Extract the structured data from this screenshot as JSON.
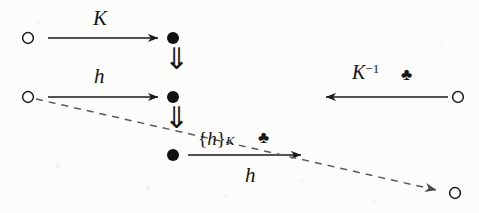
{
  "figure": {
    "kind": "commutative-diagram",
    "background_color": "#fcfcfa",
    "ink_color": "#151515",
    "width": 479,
    "height": 213
  },
  "nodes": {
    "top_left_circle": {
      "shape": "open-circle",
      "x": 28,
      "y": 38
    },
    "top_right_dot": {
      "shape": "filled-dot",
      "x": 173,
      "y": 38
    },
    "middle_left_circle": {
      "shape": "open-circle",
      "x": 28,
      "y": 97
    },
    "middle_center_dot": {
      "shape": "filled-dot",
      "x": 173,
      "y": 97
    },
    "middle_right_circle": {
      "shape": "open-circle",
      "x": 458,
      "y": 97
    },
    "bottom_center_dot": {
      "shape": "filled-dot",
      "x": 173,
      "y": 155
    },
    "bottom_right_circle": {
      "shape": "open-circle",
      "x": 455,
      "y": 193
    }
  },
  "arrows": {
    "row1": {
      "label": "K",
      "from_x": 48,
      "to_x": 162,
      "y": 38,
      "direction": "right",
      "style": "solid"
    },
    "row2": {
      "label": "h",
      "from_x": 48,
      "to_x": 162,
      "y": 97,
      "direction": "right",
      "style": "solid"
    },
    "row2_right": {
      "label": "K",
      "superscript": "-1",
      "suit": "♣",
      "from_x": 448,
      "to_x": 322,
      "y": 97,
      "direction": "left",
      "style": "solid"
    },
    "row3": {
      "label_above": "{h}",
      "label_above_sub": "K",
      "label_above_suit": "♣",
      "label_below": "h",
      "from_x": 188,
      "to_x": 305,
      "y": 155,
      "direction": "right",
      "style": "solid"
    },
    "vertical_top": {
      "glyph": "⇓",
      "x": 173,
      "from_y": 50,
      "to_y": 86
    },
    "vertical_bottom": {
      "glyph": "⇓",
      "x": 173,
      "from_y": 108,
      "to_y": 144
    },
    "diagonal_dashed": {
      "style": "dashed",
      "from_x": 36,
      "from_y": 99,
      "to_x": 440,
      "to_y": 191,
      "direction": "right-down"
    }
  },
  "labels": {
    "k_top": "K",
    "h_middle": "h",
    "k_inverse_base": "K",
    "k_inverse_sup": "−1",
    "club_right": "♣",
    "brace_open": "{",
    "brace_h": "h",
    "brace_close": "}",
    "brace_sub": "K",
    "club_bottom": "♣",
    "h_bottom": "h"
  }
}
